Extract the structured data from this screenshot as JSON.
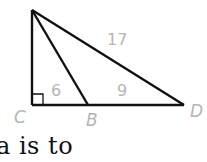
{
  "diagram": {
    "type": "right triangle with cevian",
    "points": {
      "A": {
        "label": "",
        "x": 32,
        "y": 10
      },
      "C": {
        "label": "C",
        "x": 32,
        "y": 105
      },
      "B": {
        "label": "B",
        "x": 88,
        "y": 105
      },
      "D": {
        "label": "D",
        "x": 184,
        "y": 105
      }
    },
    "segment_labels": {
      "AD": "17",
      "CB": "6",
      "BD": "9"
    },
    "right_angle_at": "C"
  },
  "caption": "a is to"
}
